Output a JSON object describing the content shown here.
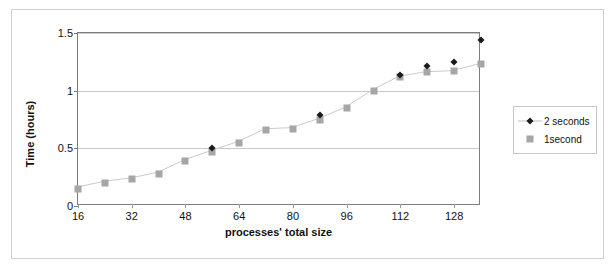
{
  "chart_data": {
    "type": "line",
    "title": "",
    "xlabel": "processes' total size",
    "ylabel": "Time (hours)",
    "xlim": [
      16,
      136
    ],
    "ylim": [
      0,
      1.5
    ],
    "xticks": [
      16,
      32,
      48,
      64,
      80,
      96,
      112,
      128
    ],
    "yticks": [
      "0",
      "0.5",
      "1",
      "1.5"
    ],
    "ytick_values": [
      0,
      0.5,
      1,
      1.5
    ],
    "grid": "horizontal",
    "legend_position": "right",
    "x": [
      16,
      24,
      32,
      40,
      48,
      56,
      64,
      72,
      80,
      88,
      96,
      104,
      112,
      120,
      128,
      136
    ],
    "series": [
      {
        "name": "2 seconds",
        "marker": "diamond",
        "color": "#1a1a1a",
        "points": [
          {
            "x": 56,
            "y": 0.5
          },
          {
            "x": 88,
            "y": 0.79
          },
          {
            "x": 112,
            "y": 1.14
          },
          {
            "x": 120,
            "y": 1.21
          },
          {
            "x": 128,
            "y": 1.25
          },
          {
            "x": 136,
            "y": 1.44
          }
        ]
      },
      {
        "name": "1second",
        "marker": "square",
        "color": "#a6a6a6",
        "values": [
          0.15,
          0.2,
          0.23,
          0.28,
          0.39,
          0.47,
          0.55,
          0.66,
          0.67,
          0.75,
          0.85,
          1.0,
          1.12,
          1.16,
          1.17,
          1.23
        ]
      }
    ]
  },
  "legend": {
    "entries": [
      {
        "label": "2 seconds",
        "marker": "diamond"
      },
      {
        "label": "1second",
        "marker": "square"
      }
    ]
  }
}
